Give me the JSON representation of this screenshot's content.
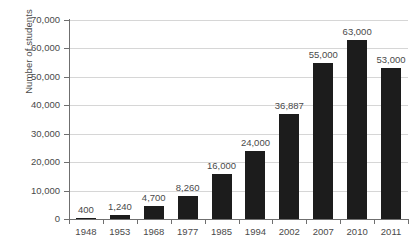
{
  "chart_data": {
    "type": "bar",
    "title": "",
    "xlabel": "",
    "ylabel": "Number of students",
    "categories": [
      "1948",
      "1953",
      "1968",
      "1977",
      "1985",
      "1994",
      "2002",
      "2007",
      "2010",
      "2011"
    ],
    "values": [
      400,
      1240,
      4700,
      8260,
      16000,
      24000,
      36887,
      55000,
      63000,
      53000
    ],
    "data_labels": [
      "400",
      "1,240",
      "4,700",
      "8,260",
      "16,000",
      "24,000",
      "36,887",
      "55,000",
      "63,000",
      "53,000"
    ],
    "ylim": [
      0,
      70000
    ],
    "ytick_values": [
      0,
      10000,
      20000,
      30000,
      40000,
      50000,
      60000,
      70000
    ],
    "ytick_labels": [
      "0",
      "10,000",
      "20,000",
      "30,000",
      "40,000",
      "50,000",
      "60,000",
      "70,000"
    ],
    "grid": true,
    "legend": "none",
    "bar_color": "#1c1c1c",
    "gridline_color": "#d6d6d6",
    "axis_color": "#6f6f6f",
    "text_color": "#4a4a4a"
  }
}
